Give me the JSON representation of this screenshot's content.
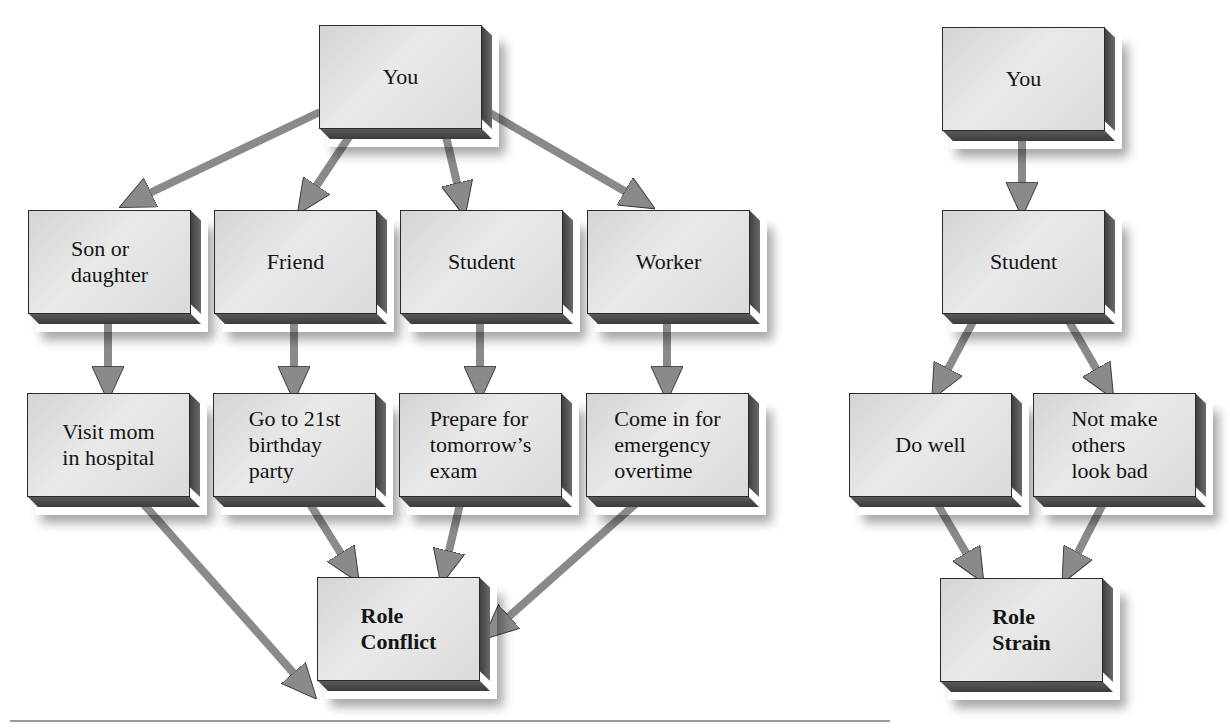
{
  "colors": {
    "box_face": "#e2e2e2",
    "box_side": "#4a4a4a",
    "arrow_fill": "#8a8a8a",
    "arrow_stroke": "#3a3a3a",
    "text": "#141414",
    "rule": "#9a9a9a"
  },
  "role_conflict": {
    "root": {
      "label": "You"
    },
    "roles": [
      {
        "label": "Son or\ndaughter"
      },
      {
        "label": "Friend"
      },
      {
        "label": "Student"
      },
      {
        "label": "Worker"
      }
    ],
    "demands": [
      {
        "label": "Visit mom\nin hospital"
      },
      {
        "label": "Go to 21st\nbirthday\nparty"
      },
      {
        "label": "Prepare for\ntomorrow’s\nexam"
      },
      {
        "label": "Come in for\nemergency\novertime"
      }
    ],
    "result": {
      "label": "Role\nConflict"
    }
  },
  "role_strain": {
    "root": {
      "label": "You"
    },
    "role": {
      "label": "Student"
    },
    "demands": [
      {
        "label": "Do well"
      },
      {
        "label": "Not make\nothers\nlook bad"
      }
    ],
    "result": {
      "label": "Role\nStrain"
    }
  }
}
